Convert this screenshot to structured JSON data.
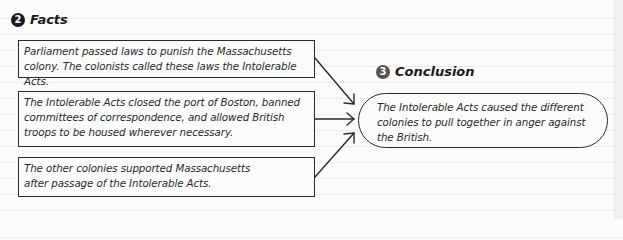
{
  "facts_section": {
    "step_number": "2",
    "heading": "Facts",
    "items": [
      {
        "line1": "Parliament passed laws to punish the Massachusetts",
        "line2": "colony. The colonists called these laws the Intolerable Acts."
      },
      {
        "line1": "The Intolerable Acts closed the port of Boston, banned",
        "line2": "committees of correspondence, and allowed British",
        "line3": "troops to be housed wherever necessary."
      },
      {
        "line1": "The other colonies supported Massachusetts",
        "line2": "after passage of the Intolerable Acts."
      }
    ]
  },
  "conclusion_section": {
    "step_number": "3",
    "heading": "Conclusion",
    "line1": "The Intolerable Acts caused the different",
    "line2": "colonies to pull together in anger against",
    "line3": "the British."
  },
  "colors": {
    "ink": "#2a2a2a",
    "paper": "#fbfbfb",
    "rule_line": "#ebebeb",
    "badge_facts": "#1a1a1a",
    "badge_conclusion": "#555555"
  }
}
